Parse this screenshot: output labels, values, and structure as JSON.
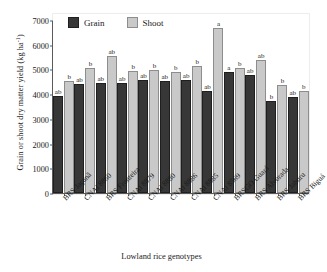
{
  "chart_data": {
    "type": "bar",
    "title": "",
    "xlabel": "Lowland rice genotypes",
    "ylabel": "Grain or shoot dry matter yield (kg ha",
    "ylabel_sup": "-1",
    "ylabel_tail": ")",
    "ylim": [
      0,
      7000
    ],
    "ytick_labels": [
      "7000",
      "6000",
      "5000",
      "4000",
      "3000",
      "2000",
      "1000",
      "0"
    ],
    "ytick_values": [
      7000,
      6000,
      5000,
      4000,
      3000,
      2000,
      1000,
      0
    ],
    "grid": false,
    "legend_position": "top-left-inside",
    "categories": [
      "BRS Jaçanã",
      "CNAi 8860",
      "BRS Fronteira",
      "CNAi 8879",
      "CNAi 8880",
      "CNAi 8886",
      "CNAi 8885",
      "CNAi 8569",
      "BRSGO Guará",
      "BRS Alvorada",
      "BRS Jaburu",
      "BRS Biguá"
    ],
    "series": [
      {
        "name": "Grain",
        "color": "#373737",
        "values": [
          3830,
          4330,
          4370,
          4360,
          4480,
          4440,
          4490,
          4050,
          4830,
          4700,
          3650,
          3790
        ],
        "letters": [
          "ab",
          "ab",
          "ab",
          "ab",
          "ab",
          "ab",
          "ab",
          "ab",
          "a",
          "ab",
          "b",
          "ab"
        ]
      },
      {
        "name": "Shoot",
        "color": "#c9c9c9",
        "values": [
          4440,
          4980,
          5450,
          4860,
          4890,
          4800,
          5050,
          6600,
          4990,
          5300,
          4300,
          4030
        ],
        "letters": [
          "b",
          "b",
          "ab",
          "b",
          "b",
          "b",
          "b",
          "a",
          "b",
          "ab",
          "b",
          "b"
        ]
      }
    ]
  },
  "legend": {
    "items": [
      {
        "label": "Grain"
      },
      {
        "label": "Shoot"
      }
    ]
  }
}
